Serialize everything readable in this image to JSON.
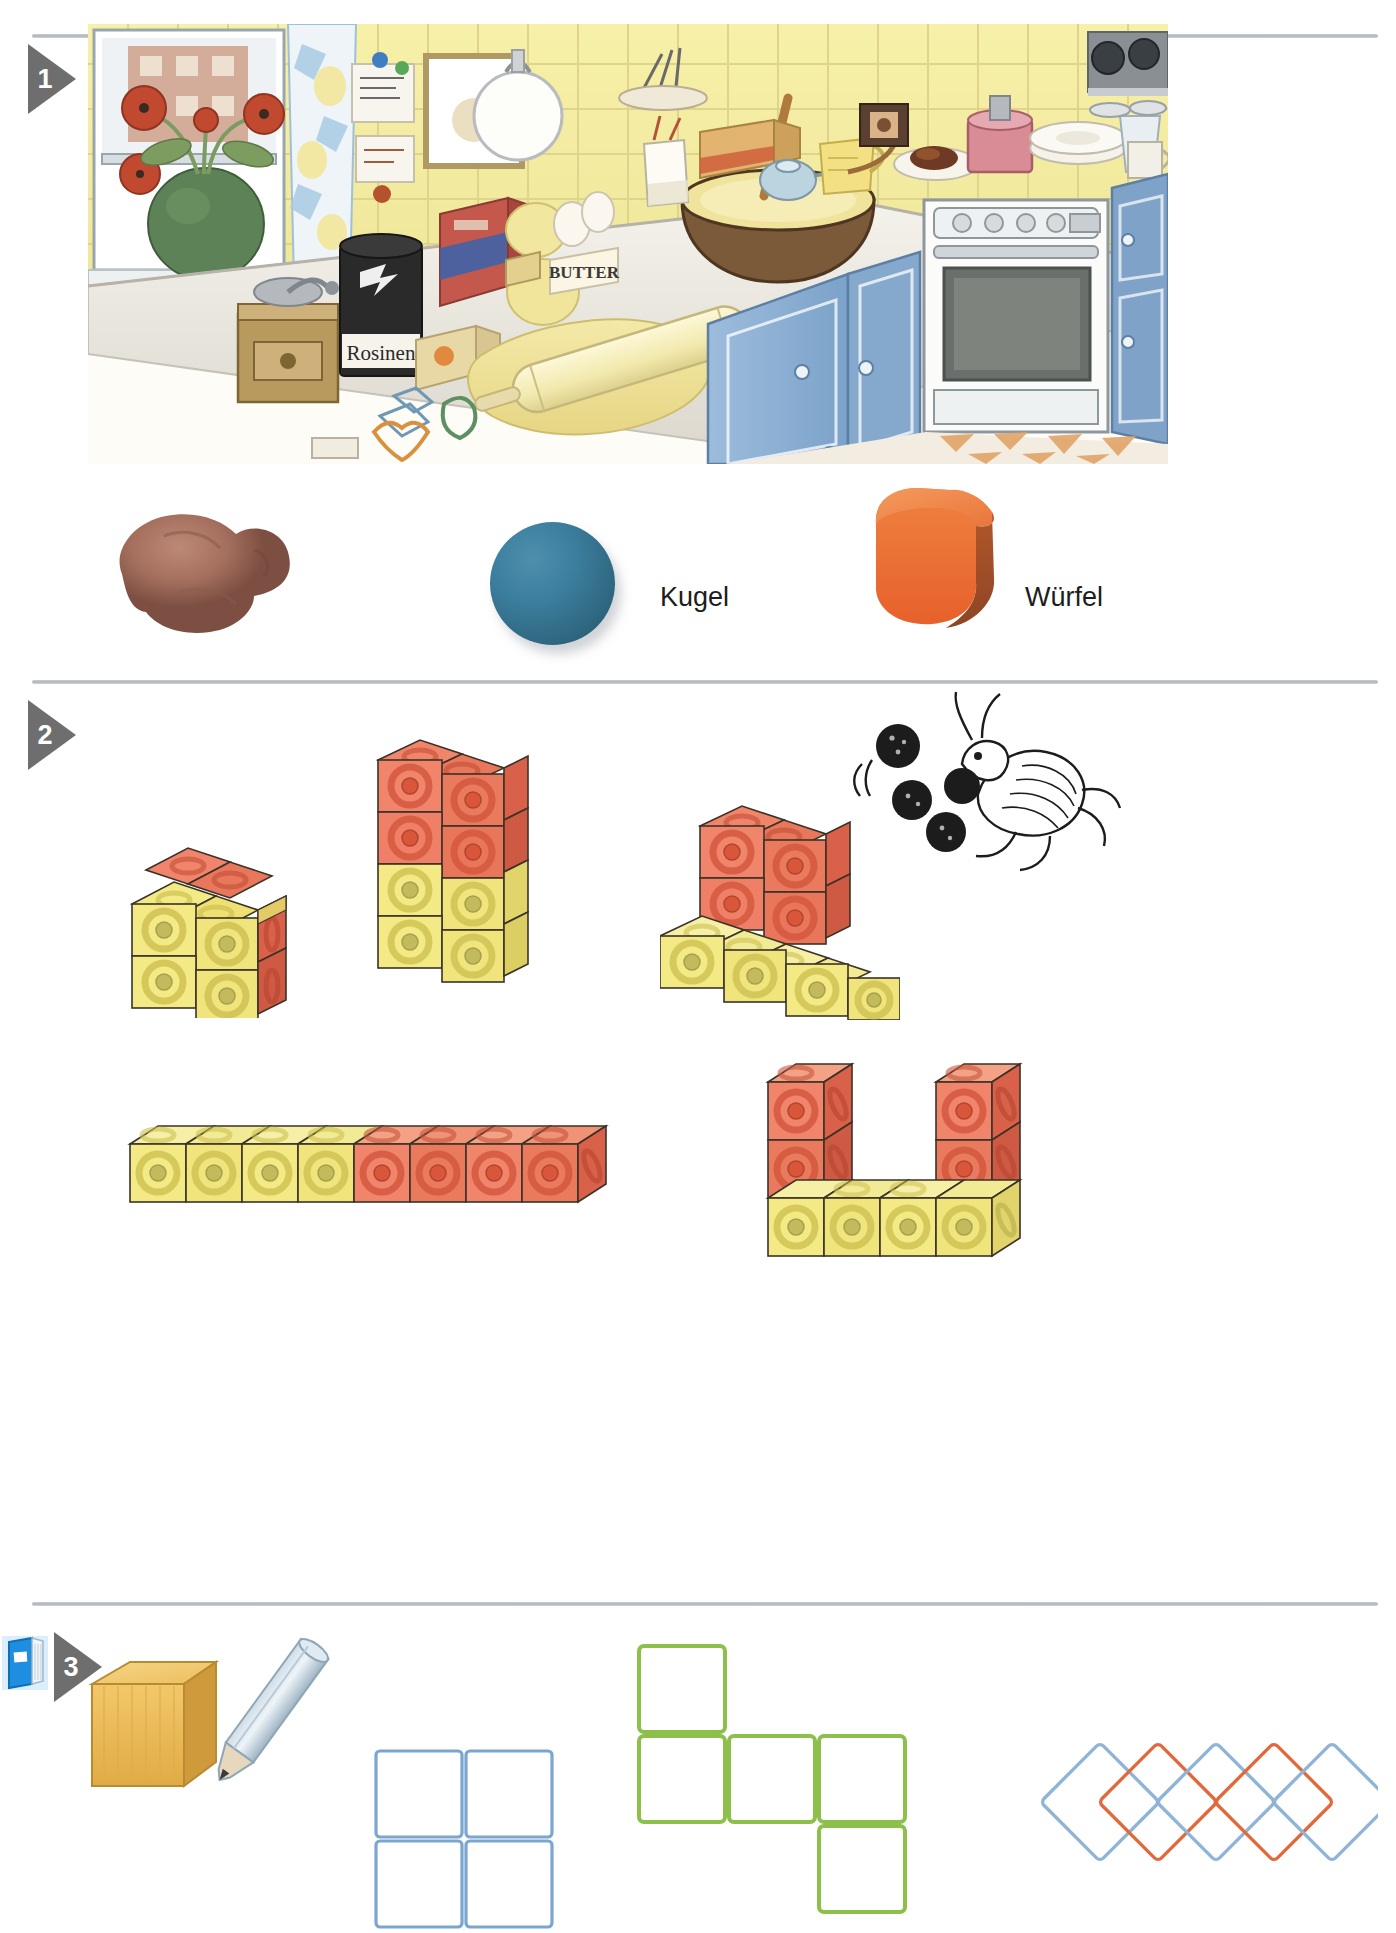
{
  "page": {
    "width": 1396,
    "height": 1920,
    "background": "#ffffff",
    "language": "de"
  },
  "sections": [
    {
      "number": "1",
      "name": "kitchen-and-shapes",
      "marker_label": "1",
      "illustration": {
        "name": "kitchen-baking-scene",
        "description": "Watercolour kitchen scene with window, flowers, baking table, rolling pin, dough, oven",
        "visible_text_items": [
          {
            "name": "raisin-can-label",
            "text": "Rosinen"
          },
          {
            "name": "butter-pack-label",
            "text": "BUTTER"
          }
        ]
      },
      "shape_examples": [
        {
          "name": "clay-lump",
          "label": "",
          "color": "#a6705f"
        },
        {
          "name": "clay-sphere",
          "label": "Kugel",
          "color": "#356f8c"
        },
        {
          "name": "clay-cube",
          "label": "Würfel",
          "color": "#e8692f"
        }
      ]
    },
    {
      "number": "2",
      "name": "cube-buildings",
      "marker_label": "2",
      "buildings": [
        {
          "name": "building-block-2x2x2",
          "cubes": 8,
          "colors": [
            "#f2e87e",
            "#ea7455"
          ]
        },
        {
          "name": "building-tower-2x4",
          "cubes": 8,
          "colors": [
            "#f2e87e",
            "#ea7455"
          ]
        },
        {
          "name": "building-step-shape",
          "cubes": 8,
          "colors": [
            "#f2e87e",
            "#ea7455"
          ]
        },
        {
          "name": "building-row-of-eight",
          "cubes": 8,
          "colors": [
            "#f2e87e",
            "#ea7455"
          ]
        },
        {
          "name": "building-u-shape",
          "cubes": 8,
          "colors": [
            "#f2e87e",
            "#ea7455"
          ]
        }
      ],
      "illustration": {
        "name": "grasshopper-juggling-balls",
        "balls": 4
      }
    },
    {
      "number": "3",
      "name": "drawing-outlines",
      "marker_label": "3",
      "book_icon": "workbook-icon",
      "tools": [
        {
          "name": "wooden-cube",
          "color": "#eab44a"
        },
        {
          "name": "pencil",
          "color": "#b9cfe0"
        }
      ],
      "outline_groups": [
        {
          "name": "blue-square-grid",
          "color": "#7ba6d0",
          "shape": "2x2-grid",
          "count": 4
        },
        {
          "name": "green-square-chain",
          "color": "#8cc04a",
          "shape": "t-chain",
          "count": 6
        },
        {
          "name": "diamond-chain",
          "shape": "overlapping-diamonds",
          "count": 5,
          "colors": [
            "#8fb4d6",
            "#e06a3c",
            "#8fb4d6",
            "#e06a3c",
            "#8fb4d6"
          ]
        }
      ]
    }
  ],
  "colors": {
    "marker_gray": "#6e6e6e",
    "divider": "#aeb4ba",
    "cube_yellow": "#f4ea85",
    "cube_yellow_top": "#f6f0a6",
    "cube_yellow_side": "#e2d96c",
    "cube_orange": "#ef7f5d",
    "cube_orange_top": "#f5a184",
    "cube_orange_side": "#d9624a",
    "outline_blue": "#7ba6d0",
    "outline_green": "#8cc04a",
    "diamond_blue": "#8fb4d6",
    "diamond_orange": "#e06a3c",
    "book_blue": "#1a9ee6"
  }
}
